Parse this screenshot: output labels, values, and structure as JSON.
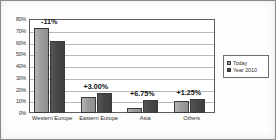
{
  "chart_data": {
    "type": "bar",
    "title": "",
    "xlabel": "",
    "ylabel": "",
    "categories": [
      "Western Europe",
      "Eastern Europe",
      "Asia",
      "Others"
    ],
    "series": [
      {
        "name": "Today",
        "values": [
          72,
          14,
          4,
          10.5
        ]
      },
      {
        "name": "Year 2010",
        "values": [
          61,
          17,
          11.5,
          12
        ]
      }
    ],
    "annotations": [
      "-11%",
      "+3.00%",
      "+6.75%",
      "+1.25%"
    ],
    "ylim": [
      0,
      80
    ],
    "ytick_values": [
      80,
      70,
      60,
      50,
      40,
      30,
      20,
      10,
      0
    ],
    "ytick_labels": [
      "80%",
      "70%",
      "60%",
      "50%",
      "40%",
      "30%",
      "20%",
      "10%",
      "0%"
    ],
    "grid": true,
    "legend_position": "right",
    "colors": {
      "series_0": "#9c9c9c",
      "series_1": "#454545",
      "gridline": "#b9b9b9",
      "axis": "#5d5d5d",
      "text": "#2b2b2b",
      "frame": "#8a8a8a"
    }
  }
}
